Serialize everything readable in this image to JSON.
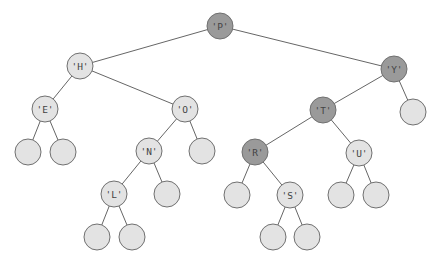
{
  "diagram": {
    "type": "binary-search-tree",
    "colors": {
      "light": "#e3e3e3",
      "dark": "#9a9a9a",
      "edge": "#666666"
    },
    "radius": 13,
    "nodes": [
      {
        "id": "P",
        "label": "'P'",
        "x": 220,
        "y": 26,
        "shade": "dark"
      },
      {
        "id": "H",
        "label": "'H'",
        "x": 80,
        "y": 66,
        "shade": "light"
      },
      {
        "id": "Y",
        "label": "'Y'",
        "x": 394,
        "y": 69,
        "shade": "dark"
      },
      {
        "id": "E",
        "label": "'E'",
        "x": 45,
        "y": 109,
        "shade": "light"
      },
      {
        "id": "O",
        "label": "'O'",
        "x": 185,
        "y": 109,
        "shade": "light"
      },
      {
        "id": "T",
        "label": "'T'",
        "x": 323,
        "y": 110,
        "shade": "dark"
      },
      {
        "id": "Yr",
        "label": "",
        "x": 413,
        "y": 112,
        "shade": "light"
      },
      {
        "id": "El",
        "label": "",
        "x": 28,
        "y": 152,
        "shade": "light"
      },
      {
        "id": "Er",
        "label": "",
        "x": 63,
        "y": 152,
        "shade": "light"
      },
      {
        "id": "N",
        "label": "'N'",
        "x": 149,
        "y": 151,
        "shade": "light"
      },
      {
        "id": "Or",
        "label": "",
        "x": 202,
        "y": 151,
        "shade": "light"
      },
      {
        "id": "R",
        "label": "'R'",
        "x": 255,
        "y": 152,
        "shade": "dark"
      },
      {
        "id": "U",
        "label": "'U'",
        "x": 359,
        "y": 153,
        "shade": "light"
      },
      {
        "id": "L",
        "label": "'L'",
        "x": 114,
        "y": 194,
        "shade": "light"
      },
      {
        "id": "Nr",
        "label": "",
        "x": 167,
        "y": 194,
        "shade": "light"
      },
      {
        "id": "Rl",
        "label": "",
        "x": 237,
        "y": 195,
        "shade": "light"
      },
      {
        "id": "S",
        "label": "'S'",
        "x": 290,
        "y": 195,
        "shade": "light"
      },
      {
        "id": "Ul",
        "label": "",
        "x": 341,
        "y": 195,
        "shade": "light"
      },
      {
        "id": "Ur",
        "label": "",
        "x": 376,
        "y": 195,
        "shade": "light"
      },
      {
        "id": "Ll",
        "label": "",
        "x": 97,
        "y": 237,
        "shade": "light"
      },
      {
        "id": "Lr",
        "label": "",
        "x": 132,
        "y": 237,
        "shade": "light"
      },
      {
        "id": "Sl",
        "label": "",
        "x": 273,
        "y": 237,
        "shade": "light"
      },
      {
        "id": "Sr",
        "label": "",
        "x": 307,
        "y": 237,
        "shade": "light"
      }
    ],
    "edges": [
      [
        "P",
        "H"
      ],
      [
        "P",
        "Y"
      ],
      [
        "H",
        "E"
      ],
      [
        "H",
        "O"
      ],
      [
        "Y",
        "T"
      ],
      [
        "Y",
        "Yr"
      ],
      [
        "E",
        "El"
      ],
      [
        "E",
        "Er"
      ],
      [
        "O",
        "N"
      ],
      [
        "O",
        "Or"
      ],
      [
        "T",
        "R"
      ],
      [
        "T",
        "U"
      ],
      [
        "N",
        "L"
      ],
      [
        "N",
        "Nr"
      ],
      [
        "R",
        "Rl"
      ],
      [
        "R",
        "S"
      ],
      [
        "U",
        "Ul"
      ],
      [
        "U",
        "Ur"
      ],
      [
        "L",
        "Ll"
      ],
      [
        "L",
        "Lr"
      ],
      [
        "S",
        "Sl"
      ],
      [
        "S",
        "Sr"
      ]
    ]
  }
}
